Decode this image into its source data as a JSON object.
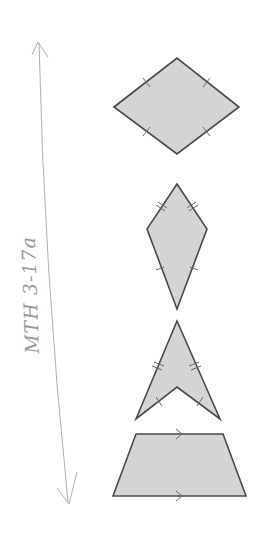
{
  "annotation": {
    "text": "MTH 3-17a"
  },
  "colors": {
    "fill": "#d4d4d4",
    "stroke": "#4a4a4a",
    "pencil": "#a8a8a8"
  },
  "shapes": [
    {
      "name": "rhombus",
      "points": "114,107 177,58 239,107 177,154",
      "marks": "single ticks on all 4 sides"
    },
    {
      "name": "kite",
      "points": "177,184 207,229 177,309 147,229",
      "marks": "double ticks on upper sides, single ticks on lower sides"
    },
    {
      "name": "dart",
      "points": "177,321 220,419 177,387 136,419",
      "marks": "double ticks on outer sides, single ticks on inner sides"
    },
    {
      "name": "trapezoid",
      "points": "136,434 223,434 246,496 113,496",
      "marks": "parallel arrows on top and bottom"
    }
  ]
}
